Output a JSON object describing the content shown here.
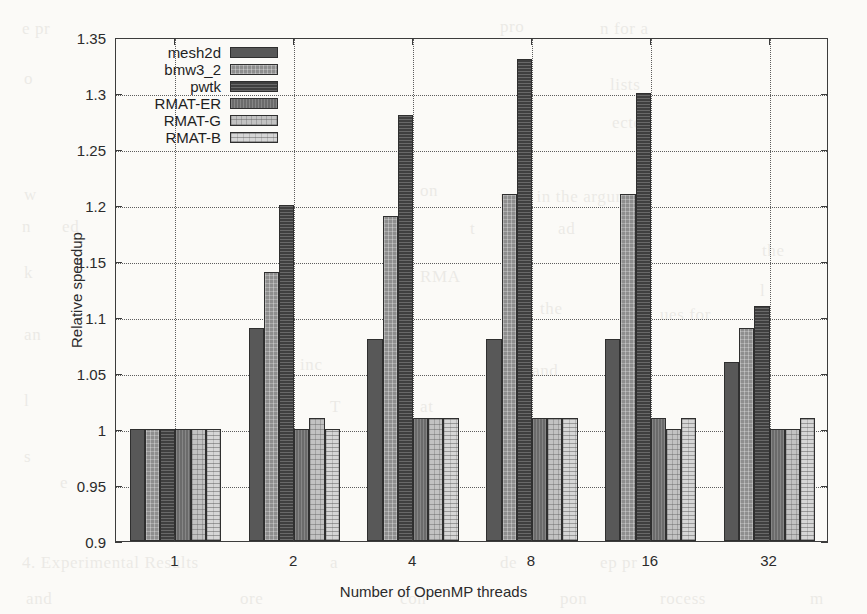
{
  "chart_data": {
    "type": "bar",
    "title": "",
    "xlabel": "Number of OpenMP threads",
    "ylabel": "Relative speedup",
    "categories": [
      "1",
      "2",
      "4",
      "8",
      "16",
      "32"
    ],
    "ylim": [
      0.9,
      1.35
    ],
    "yticks": [
      "0.9",
      "0.95",
      "1",
      "1.05",
      "1.1",
      "1.15",
      "1.2",
      "1.25",
      "1.3",
      "1.35"
    ],
    "ytick_values": [
      0.9,
      0.95,
      1.0,
      1.05,
      1.1,
      1.15,
      1.2,
      1.25,
      1.3,
      1.35
    ],
    "grid": true,
    "legend_position": "top-left-inside",
    "series": [
      {
        "name": "mesh2d",
        "values": [
          1.0,
          1.09,
          1.08,
          1.08,
          1.08,
          1.06
        ]
      },
      {
        "name": "bmw3_2",
        "values": [
          1.0,
          1.14,
          1.19,
          1.21,
          1.21,
          1.09
        ]
      },
      {
        "name": "pwtk",
        "values": [
          1.0,
          1.2,
          1.28,
          1.33,
          1.3,
          1.11
        ]
      },
      {
        "name": "RMAT-ER",
        "values": [
          1.0,
          1.0,
          1.01,
          1.01,
          1.01,
          1.0
        ]
      },
      {
        "name": "RMAT-G",
        "values": [
          1.0,
          1.01,
          1.01,
          1.01,
          1.0,
          1.0
        ]
      },
      {
        "name": "RMAT-B",
        "values": [
          1.0,
          1.0,
          1.01,
          1.01,
          1.01,
          1.01
        ]
      }
    ]
  },
  "legend": {
    "items": [
      {
        "label": "mesh2d"
      },
      {
        "label": "bmw3_2"
      },
      {
        "label": "pwtk"
      },
      {
        "label": "RMAT-ER"
      },
      {
        "label": "RMAT-G"
      },
      {
        "label": "RMAT-B"
      }
    ]
  },
  "background_text": [
    {
      "t": "e pr",
      "x": 22,
      "y": 14
    },
    {
      "t": "pro",
      "x": 500,
      "y": 12
    },
    {
      "t": "n for a",
      "x": 600,
      "y": 14
    },
    {
      "t": "o",
      "x": 24,
      "y": 64
    },
    {
      "t": "lists",
      "x": 610,
      "y": 70
    },
    {
      "t": "ecte",
      "x": 612,
      "y": 108
    },
    {
      "t": "w",
      "x": 24,
      "y": 180
    },
    {
      "t": "on",
      "x": 420,
      "y": 176
    },
    {
      "t": "uses in  the argument",
      "x": 500,
      "y": 182
    },
    {
      "t": "n",
      "x": 22,
      "y": 212
    },
    {
      "t": "ed",
      "x": 62,
      "y": 212
    },
    {
      "t": "h e",
      "x": 382,
      "y": 214
    },
    {
      "t": "t",
      "x": 470,
      "y": 214
    },
    {
      "t": "ad",
      "x": 558,
      "y": 214
    },
    {
      "t": "the",
      "x": 762,
      "y": 236
    },
    {
      "t": "k",
      "x": 24,
      "y": 258
    },
    {
      "t": "RMA",
      "x": 420,
      "y": 262
    },
    {
      "t": "l",
      "x": 760,
      "y": 276
    },
    {
      "t": "the",
      "x": 540,
      "y": 294
    },
    {
      "t": "ues for",
      "x": 660,
      "y": 300
    },
    {
      "t": "an",
      "x": 24,
      "y": 320
    },
    {
      "t": "d",
      "x": 752,
      "y": 318
    },
    {
      "t": "inc",
      "x": 300,
      "y": 350
    },
    {
      "t": "s and",
      "x": 520,
      "y": 356
    },
    {
      "t": "ch",
      "x": 746,
      "y": 352
    },
    {
      "t": "l",
      "x": 24,
      "y": 386
    },
    {
      "t": "T",
      "x": 330,
      "y": 392
    },
    {
      "t": "at",
      "x": 420,
      "y": 392
    },
    {
      "t": "in",
      "x": 505,
      "y": 392
    },
    {
      "t": "r",
      "x": 752,
      "y": 392
    },
    {
      "t": "all",
      "x": 780,
      "y": 428
    },
    {
      "t": "s",
      "x": 24,
      "y": 442
    },
    {
      "t": "e",
      "x": 60,
      "y": 468
    },
    {
      "t": "1",
      "x": 760,
      "y": 448
    },
    {
      "t": "4. Experimental Results",
      "x": 22,
      "y": 548
    },
    {
      "t": "a",
      "x": 330,
      "y": 548
    },
    {
      "t": "de",
      "x": 500,
      "y": 548
    },
    {
      "t": "ep   pr",
      "x": 600,
      "y": 548
    },
    {
      "t": "and",
      "x": 26,
      "y": 584
    },
    {
      "t": "ore",
      "x": 240,
      "y": 584
    },
    {
      "t": "con",
      "x": 400,
      "y": 584
    },
    {
      "t": "pon",
      "x": 560,
      "y": 584
    },
    {
      "t": "rocess",
      "x": 660,
      "y": 584
    },
    {
      "t": "m",
      "x": 810,
      "y": 584
    }
  ]
}
